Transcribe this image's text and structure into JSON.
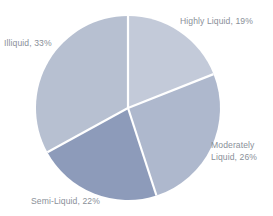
{
  "chart_data": {
    "type": "pie",
    "title": "",
    "subtitle": "",
    "xlabel": "",
    "ylabel": "",
    "legend_position": "none",
    "grid": false,
    "value_unit": "%",
    "start_angle_deg": 0,
    "direction": "clockwise",
    "categories": [
      "Highly Liquid",
      "Moderately Liquid",
      "Semi-Liquid",
      "Illiquid"
    ],
    "values": [
      19,
      26,
      22,
      33
    ],
    "slices": [
      {
        "name": "Highly Liquid",
        "value": 19,
        "label": "Highly Liquid, 19%",
        "color": "#c3cad9",
        "start_deg": 0,
        "end_deg": 68.4
      },
      {
        "name": "Moderately Liquid",
        "value": 26,
        "label": "Moderately\nLiquid, 26%",
        "color": "#aeb8cd",
        "start_deg": 68.4,
        "end_deg": 162.0
      },
      {
        "name": "Semi-Liquid",
        "value": 22,
        "label": "Semi-Liquid, 22%",
        "color": "#8d9bba",
        "start_deg": 162.0,
        "end_deg": 241.2
      },
      {
        "name": "Illiquid",
        "value": 33,
        "label": "Illiquid, 33%",
        "color": "#b7c0d1",
        "start_deg": 241.2,
        "end_deg": 360.0
      }
    ]
  },
  "style": {
    "background": "#ffffff",
    "label_color": "#8a9099",
    "divider_color": "#ffffff"
  },
  "geometry": {
    "center_x": 128,
    "center_y": 108,
    "radius": 92
  }
}
